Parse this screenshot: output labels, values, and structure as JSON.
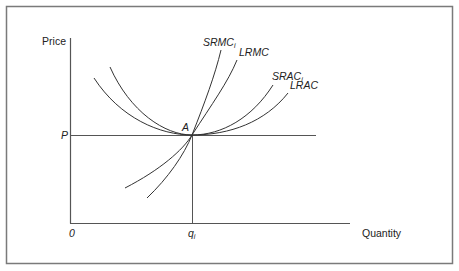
{
  "figure": {
    "frame_color": "#7a7a7a",
    "axis_color": "#555555",
    "curve_color": "#333333",
    "axes": {
      "y_label": "Price",
      "x_label": "Quantity",
      "origin_label": "0",
      "price_level_label": "P",
      "quantity_label": "q",
      "quantity_subscript": "i"
    },
    "point": {
      "label": "A"
    },
    "curves": [
      {
        "id": "srmc",
        "label": "SRMC",
        "subscript": "i",
        "type": "short-run marginal cost"
      },
      {
        "id": "lrmc",
        "label": "LRMC",
        "subscript": "",
        "type": "long-run marginal cost"
      },
      {
        "id": "srac",
        "label": "SRAC",
        "subscript": "i",
        "type": "short-run average cost"
      },
      {
        "id": "lrac",
        "label": "LRAC",
        "subscript": "",
        "type": "long-run average cost"
      }
    ]
  }
}
